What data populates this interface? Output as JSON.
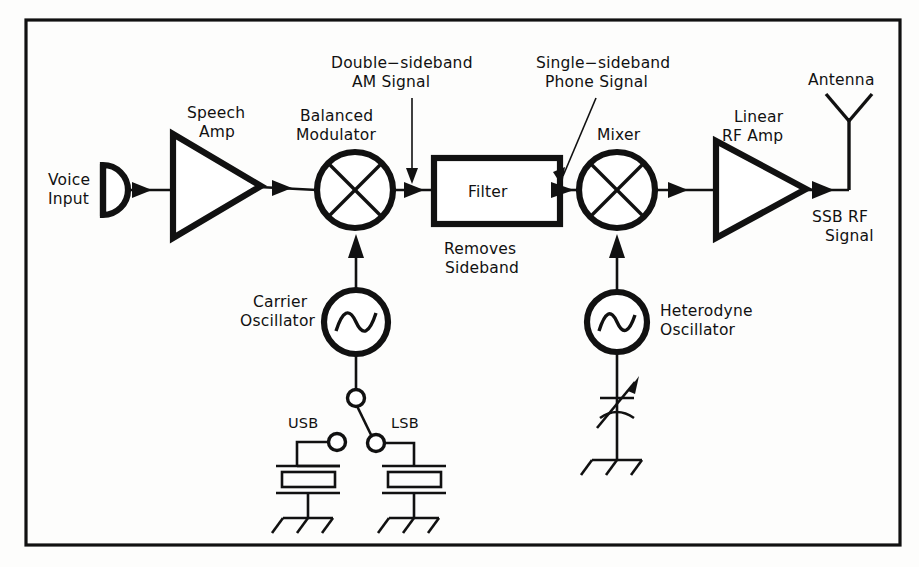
{
  "figure": {
    "background_color": "#fdfdfc",
    "ink_color": "#111111",
    "frame": {
      "x": 26,
      "y": 20,
      "width": 874,
      "height": 525
    }
  },
  "labels": {
    "voice_input_line1": "Voice",
    "voice_input_line2": "Input",
    "speech_amp_line1": "Speech",
    "speech_amp_line2": "Amp",
    "balanced_modulator_line1": "Balanced",
    "balanced_modulator_line2": "Modulator",
    "dsb_line1": "Double−sideband",
    "dsb_line2": "AM  Signal",
    "filter": "Filter",
    "filter_note_line1": "Removes",
    "filter_note_line2": "Sideband",
    "ssb_phone_line1": "Single−sideband",
    "ssb_phone_line2": "Phone  Signal",
    "mixer": "Mixer",
    "linear_rf_amp_line1": "Linear",
    "linear_rf_amp_line2": "RF  Amp",
    "antenna": "Antenna",
    "ssb_rf_line1": "SSB  RF",
    "ssb_rf_line2": "Signal",
    "carrier_osc_line1": "Carrier",
    "carrier_osc_line2": "Oscillator",
    "usb": "USB",
    "lsb": "LSB",
    "heterodyne_osc_line1": "Heterodyne",
    "heterodyne_osc_line2": "Oscillator"
  },
  "blocks": [
    {
      "id": "microphone",
      "name": "Voice Input",
      "type": "microphone",
      "cx": 110,
      "cy": 190
    },
    {
      "id": "speech-amp",
      "name": "Speech Amp",
      "type": "amplifier",
      "x": 171,
      "y": 133,
      "width": 90,
      "height": 106
    },
    {
      "id": "balanced-modulator",
      "name": "Balanced Modulator",
      "type": "mixer",
      "cx": 355,
      "cy": 190,
      "r": 38
    },
    {
      "id": "filter",
      "name": "Filter",
      "type": "box",
      "x": 433,
      "y": 157,
      "width": 127,
      "height": 67
    },
    {
      "id": "mixer",
      "name": "Mixer",
      "type": "mixer",
      "cx": 617,
      "cy": 190,
      "r": 38
    },
    {
      "id": "linear-rf-amp",
      "name": "Linear RF Amp",
      "type": "amplifier",
      "x": 714,
      "y": 140,
      "width": 93,
      "height": 99
    },
    {
      "id": "antenna",
      "name": "Antenna",
      "type": "antenna",
      "cx": 849,
      "cy": 190
    },
    {
      "id": "carrier-oscillator",
      "name": "Carrier Oscillator",
      "type": "oscillator",
      "cx": 356,
      "cy": 322,
      "r": 32
    },
    {
      "id": "heterodyne-oscillator",
      "name": "Heterodyne Oscillator",
      "type": "oscillator",
      "cx": 617,
      "cy": 322,
      "r": 30
    },
    {
      "id": "sideband-switch",
      "name": "Sideband Selector Switch",
      "type": "spdt-switch",
      "cx": 355,
      "cy": 398
    },
    {
      "id": "usb-crystal",
      "name": "USB Crystal",
      "type": "crystal",
      "cx": 318,
      "cy": 480
    },
    {
      "id": "lsb-crystal",
      "name": "LSB Crystal",
      "type": "crystal",
      "cx": 390,
      "cy": 480
    },
    {
      "id": "variable-capacitor",
      "name": "Tuning Variable Capacitor",
      "type": "var-cap",
      "cx": 617,
      "cy": 408
    }
  ],
  "signal_path": [
    "Voice Input",
    "Speech Amp",
    "Balanced Modulator",
    "Filter",
    "Mixer",
    "Linear RF Amp",
    "Antenna"
  ],
  "annotations": [
    {
      "id": "dsb-annotation",
      "text_line1": "Double−sideband",
      "text_line2": "AM  Signal",
      "points_to": "Balanced Modulator output",
      "arrow": "vertical"
    },
    {
      "id": "ssb-annotation",
      "text_line1": "Single−sideband",
      "text_line2": "Phone  Signal",
      "points_to": "Filter output",
      "arrow": "diagonal"
    }
  ]
}
